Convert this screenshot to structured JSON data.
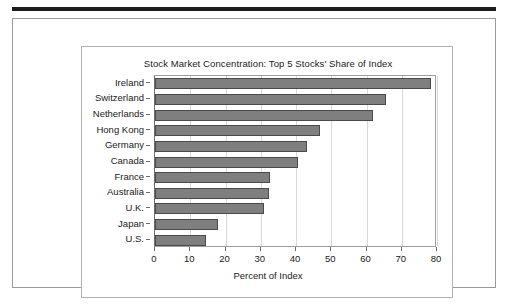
{
  "chart_data": {
    "type": "bar",
    "orientation": "horizontal",
    "title": "Stock Market Concentration: Top 5 Stocks' Share of Index",
    "xlabel": "Percent of Index",
    "ylabel": "",
    "xlim": [
      0,
      80
    ],
    "xticks": [
      0,
      10,
      20,
      30,
      40,
      50,
      60,
      70,
      80
    ],
    "xtick_labels": [
      "0",
      "10",
      "20",
      "30",
      "40",
      "50",
      "60",
      "70",
      "80"
    ],
    "grid": "vertical",
    "legend": "none",
    "bar_color": "#7f7f7f",
    "bar_edge_color": "#4a4a4a",
    "categories": [
      "Ireland",
      "Switzerland",
      "Netherlands",
      "Hong Kong",
      "Germany",
      "Canada",
      "France",
      "Australia",
      "U.K.",
      "Japan",
      "U.S."
    ],
    "values": [
      78.3,
      65.5,
      61.8,
      46.8,
      43.2,
      40.5,
      32.6,
      32.4,
      31.0,
      17.8,
      14.5
    ]
  }
}
